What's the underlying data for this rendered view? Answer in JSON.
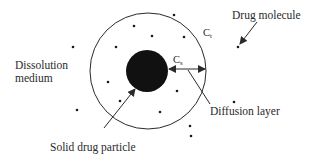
{
  "diagram": {
    "type": "dissolution-diffusion-layer-model",
    "labels": {
      "dissolution_medium_line1": "Dissolution",
      "dissolution_medium_line2": "medium",
      "drug_molecule": "Drug molecule",
      "diffusion_layer": "Diffusion layer",
      "solid_drug_particle": "Solid drug particle",
      "bulk_concentration_main": "C",
      "bulk_concentration_sub": "t",
      "surface_concentration_main": "C",
      "surface_concentration_sub": "s"
    },
    "colors": {
      "stroke": "#2a2a2a",
      "particle_fill": "#111111",
      "background": "#ffffff"
    },
    "geometry": {
      "outer_circle": {
        "cx": 148,
        "cy": 71,
        "r": 58
      },
      "particle": {
        "cx": 147,
        "cy": 71,
        "r": 21
      }
    },
    "molecules": [
      {
        "x": 73,
        "y": 47
      },
      {
        "x": 134,
        "y": 26
      },
      {
        "x": 152,
        "y": 36
      },
      {
        "x": 174,
        "y": 15
      },
      {
        "x": 116,
        "y": 47
      },
      {
        "x": 184,
        "y": 37
      },
      {
        "x": 108,
        "y": 82
      },
      {
        "x": 120,
        "y": 101
      },
      {
        "x": 177,
        "y": 91
      },
      {
        "x": 160,
        "y": 112
      },
      {
        "x": 77,
        "y": 110
      },
      {
        "x": 234,
        "y": 102
      },
      {
        "x": 238,
        "y": 47
      },
      {
        "x": 191,
        "y": 136
      },
      {
        "x": 190,
        "y": 126
      }
    ]
  }
}
